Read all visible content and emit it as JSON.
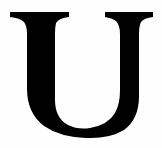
{
  "glyph": {
    "character": "U",
    "color": "#000000",
    "background": "#fefefe"
  }
}
